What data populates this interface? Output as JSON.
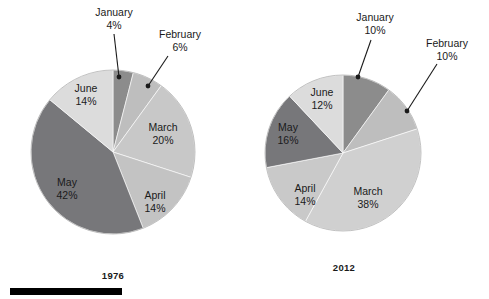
{
  "chart_data": [
    {
      "type": "pie",
      "title": "1976",
      "categories": [
        "January",
        "February",
        "March",
        "April",
        "May",
        "June"
      ],
      "values": [
        4,
        6,
        20,
        14,
        42,
        14
      ],
      "value_labels": [
        "4%",
        "6%",
        "20%",
        "14%",
        "42%",
        "14%"
      ],
      "colors": [
        "#8c8c8c",
        "#bebebe",
        "#c8c8c8",
        "#c3c3c3",
        "#77777a",
        "#dcdcdc"
      ],
      "legend": "none",
      "label_mode": "inside-and-callout",
      "start_angle_deg": 0,
      "direction": "clockwise",
      "geometry": {
        "cx": 113,
        "cy": 152,
        "r": 82
      },
      "slice_labels": [
        {
          "name": "January",
          "pct": "4%",
          "placement": "callout",
          "label_x": 114,
          "label_y": 16,
          "pct_x": 114,
          "pct_y": 29,
          "anchor": "middle",
          "leader_from_x": 114,
          "leader_from_y": 34,
          "leader_to_x": 119,
          "leader_to_y": 77
        },
        {
          "name": "February",
          "pct": "6%",
          "placement": "callout",
          "label_x": 180,
          "label_y": 38,
          "pct_x": 180,
          "pct_y": 51,
          "anchor": "middle",
          "leader_from_x": 168,
          "leader_from_y": 56,
          "leader_to_x": 148,
          "leader_to_y": 86
        },
        {
          "name": "March",
          "pct": "20%",
          "placement": "inside",
          "label_x": 163,
          "label_y": 131,
          "pct_x": 163,
          "pct_y": 144,
          "anchor": "middle"
        },
        {
          "name": "April",
          "pct": "14%",
          "placement": "inside",
          "label_x": 155,
          "label_y": 199,
          "pct_x": 155,
          "pct_y": 212,
          "anchor": "middle"
        },
        {
          "name": "May",
          "pct": "42%",
          "placement": "inside",
          "label_x": 67,
          "label_y": 186,
          "pct_x": 67,
          "pct_y": 199,
          "anchor": "middle"
        },
        {
          "name": "June",
          "pct": "14%",
          "placement": "inside",
          "label_x": 86,
          "label_y": 92,
          "pct_x": 86,
          "pct_y": 105,
          "anchor": "middle"
        }
      ]
    },
    {
      "type": "pie",
      "title": "2012",
      "categories": [
        "January",
        "February",
        "March",
        "April",
        "May",
        "June"
      ],
      "values": [
        10,
        10,
        38,
        14,
        16,
        12
      ],
      "value_labels": [
        "10%",
        "10%",
        "38%",
        "14%",
        "16%",
        "12%"
      ],
      "colors": [
        "#8c8c8c",
        "#bebebe",
        "#d0d0d0",
        "#c9c9c9",
        "#77777a",
        "#dcdcdc"
      ],
      "legend": "none",
      "label_mode": "inside-and-callout",
      "start_angle_deg": 0,
      "direction": "clockwise",
      "geometry": {
        "cx": 343,
        "cy": 153,
        "r": 78
      },
      "slice_labels": [
        {
          "name": "January",
          "pct": "10%",
          "placement": "callout",
          "label_x": 375,
          "label_y": 21,
          "pct_x": 375,
          "pct_y": 34,
          "anchor": "middle",
          "leader_from_x": 371,
          "leader_from_y": 40,
          "leader_to_x": 358,
          "leader_to_y": 77
        },
        {
          "name": "February",
          "pct": "10%",
          "placement": "callout",
          "label_x": 447,
          "label_y": 47,
          "pct_x": 447,
          "pct_y": 60,
          "anchor": "middle",
          "leader_from_x": 437,
          "leader_from_y": 64,
          "leader_to_x": 407,
          "leader_to_y": 111
        },
        {
          "name": "March",
          "pct": "38%",
          "placement": "inside",
          "label_x": 368,
          "label_y": 195,
          "pct_x": 368,
          "pct_y": 208,
          "anchor": "middle"
        },
        {
          "name": "April",
          "pct": "14%",
          "placement": "inside",
          "label_x": 305,
          "label_y": 192,
          "pct_x": 305,
          "pct_y": 205,
          "anchor": "middle"
        },
        {
          "name": "May",
          "pct": "16%",
          "placement": "inside",
          "label_x": 288,
          "label_y": 131,
          "pct_x": 288,
          "pct_y": 144,
          "anchor": "middle"
        },
        {
          "name": "June",
          "pct": "12%",
          "placement": "inside",
          "label_x": 322,
          "label_y": 96,
          "pct_x": 322,
          "pct_y": 109,
          "anchor": "middle"
        }
      ]
    }
  ],
  "charts": {
    "left": {
      "year": "1976",
      "year_x": 113,
      "year_y": 279
    },
    "right": {
      "year": "2012",
      "year_x": 344,
      "year_y": 271
    }
  },
  "scale_bar": {
    "x": 10,
    "y": 288,
    "width": 112,
    "height": 7,
    "color": "#000000"
  }
}
